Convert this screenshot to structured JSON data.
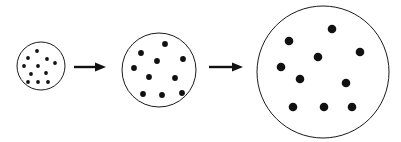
{
  "figure": {
    "title": "",
    "background_color": "#ffffff",
    "width": 401,
    "height": 142,
    "stroke_color": "#1a1a1a",
    "dot_color": "#111111",
    "arrow_color": "#111111"
  },
  "chart_data": {
    "type": "scatter",
    "title": "",
    "xlabel": "",
    "ylabel": "",
    "grid": false,
    "legend": null,
    "stages": [
      {
        "name": "stage-1",
        "label": "",
        "circle": {
          "cx": 41,
          "cy": 66,
          "r": 24,
          "stroke_width": 1
        },
        "dot_count": 11,
        "dot_radius": 1.9,
        "dots": [
          {
            "x": 37,
            "y": 51
          },
          {
            "x": 28,
            "y": 58
          },
          {
            "x": 47,
            "y": 59
          },
          {
            "x": 24,
            "y": 66
          },
          {
            "x": 38,
            "y": 66
          },
          {
            "x": 55,
            "y": 63
          },
          {
            "x": 31,
            "y": 74
          },
          {
            "x": 46,
            "y": 73
          },
          {
            "x": 28,
            "y": 82
          },
          {
            "x": 38,
            "y": 82
          },
          {
            "x": 48,
            "y": 82
          }
        ]
      },
      {
        "name": "stage-2",
        "label": "",
        "circle": {
          "cx": 159,
          "cy": 70,
          "r": 37,
          "stroke_width": 1
        },
        "dot_count": 10,
        "dot_radius": 2.9,
        "dots": [
          {
            "x": 165,
            "y": 44
          },
          {
            "x": 141,
            "y": 53
          },
          {
            "x": 183,
            "y": 59
          },
          {
            "x": 157,
            "y": 61
          },
          {
            "x": 134,
            "y": 68
          },
          {
            "x": 149,
            "y": 77
          },
          {
            "x": 175,
            "y": 78
          },
          {
            "x": 143,
            "y": 94
          },
          {
            "x": 162,
            "y": 95
          },
          {
            "x": 182,
            "y": 93
          }
        ]
      },
      {
        "name": "stage-3",
        "label": "",
        "circle": {
          "cx": 323,
          "cy": 72,
          "r": 66,
          "stroke_width": 1
        },
        "dot_count": 10,
        "dot_radius": 4.3,
        "dots": [
          {
            "x": 332,
            "y": 29
          },
          {
            "x": 289,
            "y": 41
          },
          {
            "x": 360,
            "y": 52
          },
          {
            "x": 318,
            "y": 57
          },
          {
            "x": 281,
            "y": 67
          },
          {
            "x": 300,
            "y": 79
          },
          {
            "x": 346,
            "y": 83
          },
          {
            "x": 293,
            "y": 107
          },
          {
            "x": 324,
            "y": 107
          },
          {
            "x": 352,
            "y": 107
          }
        ]
      }
    ],
    "arrows": [
      {
        "name": "arrow-1",
        "label": "",
        "x1": 74,
        "x2": 106,
        "y": 67,
        "shaft_thickness": 2.4,
        "head_length": 11,
        "head_width": 9
      },
      {
        "name": "arrow-2",
        "label": "",
        "x1": 209,
        "x2": 243,
        "y": 67,
        "shaft_thickness": 2.4,
        "head_length": 11,
        "head_width": 9
      }
    ]
  }
}
